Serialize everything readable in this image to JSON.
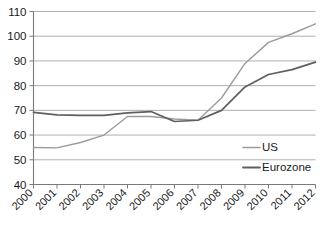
{
  "chart_data": {
    "type": "line",
    "title": "",
    "subtitle": "",
    "xlabel": "",
    "ylabel": "",
    "x": [
      "2000",
      "2001",
      "2002",
      "2003",
      "2004",
      "2005",
      "2006",
      "2007",
      "2008",
      "2009",
      "2010",
      "2011",
      "2012"
    ],
    "categories": [
      "2000",
      "2001",
      "2002",
      "2003",
      "2004",
      "2005",
      "2006",
      "2007",
      "2008",
      "2009",
      "2010",
      "2011",
      "2012"
    ],
    "series": [
      {
        "name": "US",
        "color": "#9b9b9b",
        "values": [
          55,
          54.8,
          57,
          60,
          67.5,
          67.5,
          66.5,
          66,
          75,
          89,
          97.5,
          101,
          105
        ]
      },
      {
        "name": "Eurozone",
        "color": "#5f5f5f",
        "values": [
          69.2,
          68.2,
          68,
          68,
          69,
          69.5,
          65.5,
          66,
          70,
          79.5,
          84.5,
          86.5,
          89.5
        ]
      }
    ],
    "ylim": [
      40,
      110
    ],
    "yticks": [
      40,
      50,
      60,
      70,
      80,
      90,
      100,
      110
    ],
    "ytick_labels": [
      "40",
      "50",
      "60",
      "70",
      "80",
      "90",
      "100",
      "110"
    ],
    "grid": true,
    "grid_axis": "y",
    "legend_position": "inside-right",
    "legend": [
      {
        "label": "US",
        "color": "#9b9b9b"
      },
      {
        "label": "Eurozone",
        "color": "#5f5f5f"
      }
    ]
  }
}
